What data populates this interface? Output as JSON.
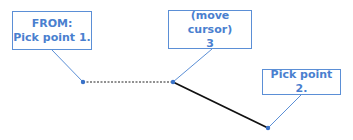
{
  "callouts": {
    "from": {
      "line1": "FROM:",
      "line2": "Pick point 1."
    },
    "move": {
      "line1": "(move cursor)",
      "line2": "3"
    },
    "pick2": {
      "line1": "Pick point 2."
    }
  },
  "colors": {
    "callout_text": "#4a7fcf",
    "callout_border": "#5b8fd6",
    "leader": "#5b8fd6",
    "point": "#3a72c8",
    "solid_line": "#111111",
    "dashed_line": "#222222"
  }
}
